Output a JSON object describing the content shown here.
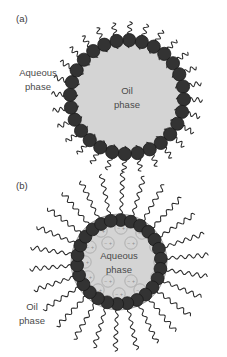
{
  "figure": {
    "background_color": "#ffffff",
    "width": 227,
    "height": 357
  },
  "palette": {
    "head_color": "#333333",
    "head_stroke": "#1a1a1a",
    "core_fill": "#d4d4d4",
    "core_stroke": "#8f8f8f",
    "tail_color": "#2b2b2b",
    "ion_circle_stroke": "#a8a8a8",
    "ion_sign_color": "#8d8d8d",
    "text_color": "#4a4a4a"
  },
  "panels": [
    {
      "id": "panel-a",
      "label": "(a)",
      "type": "oil-in-water-micelle",
      "description": "Normal micelle: hydrophilic head groups face outward to the aqueous phase, hydrophobic tails point inward into the oil core",
      "center_label_line1": "Oil",
      "center_label_line2": "phase",
      "outer_label_line1": "Aqueous",
      "outer_label_line2": "phase",
      "geometry": {
        "cx": 127,
        "cy": 97,
        "core_radius": 55,
        "head_ring_radius": 57,
        "head_radius": 6.6,
        "head_count": 28,
        "tail_direction": "inward",
        "tail_length": 26,
        "tail_waves": 4
      },
      "ions": []
    },
    {
      "id": "panel-b",
      "label": "(b)",
      "type": "water-in-oil-reverse-micelle",
      "description": "Reverse micelle: head groups face inward to the encapsulated aqueous core, tails radiate outward into the oil phase",
      "center_label_line1": "Aqueous",
      "center_label_line2": "phase",
      "outer_label_line1": "Oil",
      "outer_label_line2": "phase",
      "geometry": {
        "cx": 119,
        "cy": 262,
        "core_radius": 48,
        "head_ring_radius": 42,
        "head_radius": 6.4,
        "head_count": 26,
        "tail_direction": "outward",
        "tail_length": 42,
        "tail_waves": 5
      },
      "ions": {
        "symbol_negative": "−",
        "symbol_positive": "+",
        "circle_radius": 6.2,
        "count": 16,
        "positions": [
          [
            101,
            231
          ],
          [
            121,
            228
          ],
          [
            142,
            233
          ],
          [
            90,
            247
          ],
          [
            156,
            247
          ],
          [
            85,
            262
          ],
          [
            160,
            262
          ],
          [
            88,
            277
          ],
          [
            157,
            277
          ],
          [
            98,
            290
          ],
          [
            119,
            294
          ],
          [
            140,
            290
          ],
          [
            108,
            243
          ],
          [
            131,
            243
          ],
          [
            108,
            281
          ],
          [
            131,
            281
          ]
        ]
      }
    }
  ]
}
